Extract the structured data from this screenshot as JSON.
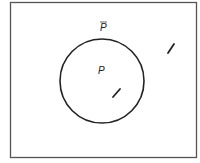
{
  "diagram": {
    "type": "venn",
    "universe": {
      "x": 10,
      "y": 2,
      "width": 187,
      "height": 155
    },
    "set": {
      "label": "P",
      "cx": 102,
      "cy": 81,
      "r": 42
    },
    "complement": {
      "label": "P",
      "overline": true
    },
    "marks": [
      {
        "region": "inside-P",
        "x1": 113,
        "y1": 97,
        "x2": 120,
        "y2": 89
      },
      {
        "region": "outside-P",
        "x1": 168,
        "y1": 53,
        "x2": 174,
        "y2": 44
      }
    ],
    "colors": {
      "stroke": "#222222",
      "frame": "#555555",
      "background": "#ffffff"
    }
  }
}
